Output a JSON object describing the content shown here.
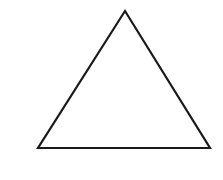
{
  "diagram": {
    "background": "#ffffff",
    "shapes": [
      {
        "type": "triangle",
        "kind": "equilateral-outline",
        "stroke": "#1a1a1a",
        "stroke_width": 2.2,
        "fill": "none",
        "points": [
          [
            125,
            11
          ],
          [
            38,
            148
          ],
          [
            210,
            148
          ]
        ]
      }
    ]
  }
}
